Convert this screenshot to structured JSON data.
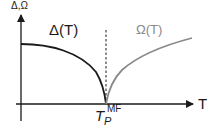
{
  "diagram": {
    "y_axis_label": "Δ,Ω",
    "x_axis_label": "T",
    "curves": [
      {
        "name": "Δ(T)",
        "label": "Δ(T)",
        "color": "#1a1a1a",
        "description": "decreasing to zero at T_P^MF"
      },
      {
        "name": "Ω(T)",
        "label": "Ω(T)",
        "color": "#8a8a8a",
        "description": "increasing from zero at T_P^MF"
      }
    ],
    "critical_point": {
      "symbol": "T",
      "subscript": "P",
      "superscript": "MF"
    },
    "colors": {
      "axis": "#1a1a1a",
      "delta": "#1a1a1a",
      "omega": "#8a8a8a",
      "dashed": "#1a1a1a"
    }
  }
}
